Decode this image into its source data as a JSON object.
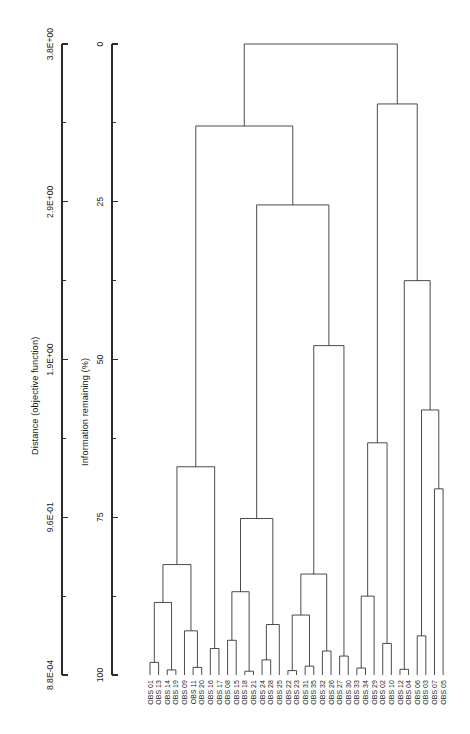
{
  "figure": {
    "kind": "dendrogram",
    "background_color": "#ffffff",
    "line_color": "#2b2b2b",
    "orientation": "labels-at-bottom-rotated"
  },
  "axes": {
    "distance": {
      "title": "Distance (objective function)",
      "tick_labels": [
        "8.8E-04",
        "9.6E-01",
        "1.9E+00",
        "2.9E+00",
        "3.8E+00"
      ],
      "tick_values": [
        0.00088,
        0.96,
        1.9,
        2.9,
        3.8
      ],
      "minor_ticks_between": 1
    },
    "information": {
      "title": "Information remaining (%)",
      "tick_labels": [
        "100",
        "75",
        "50",
        "25",
        "0"
      ],
      "tick_values": [
        100,
        75,
        50,
        25,
        0
      ],
      "minor_ticks_between": 1
    }
  },
  "chart_data": {
    "type": "dendrogram",
    "title": "",
    "xlabel": "",
    "ylabel": "Distance (objective function)",
    "secondary_ylabel": "Information remaining (%)",
    "distance_axis_range": [
      0.00088,
      3.8
    ],
    "information_axis_range": [
      100,
      0
    ],
    "grid": false,
    "legend": "none",
    "n_leaves": 35,
    "leaves": [
      "OBS 01",
      "OBS 13",
      "OBS 14",
      "OBS 19",
      "OBS 09",
      "OBS 11",
      "OBS 20",
      "OBS 16",
      "OBS 17",
      "OBS 08",
      "OBS 15",
      "OBS 18",
      "OBS 21",
      "OBS 24",
      "OBS 28",
      "OBS 25",
      "OBS 22",
      "OBS 23",
      "OBS 31",
      "OBS 35",
      "OBS 32",
      "OBS 26",
      "OBS 27",
      "OBS 30",
      "OBS 33",
      "OBS 34",
      "OBS 29",
      "OBS 02",
      "OBS 10",
      "OBS 12",
      "OBS 04",
      "OBS 06",
      "OBS 03",
      "OBS 07",
      "OBS 05"
    ],
    "merges": [
      {
        "id": "m1",
        "left": "OBS 01",
        "right": "OBS 13",
        "info_remaining": 98.0
      },
      {
        "id": "m2",
        "left": "OBS 14",
        "right": "OBS 19",
        "info_remaining": 99.2
      },
      {
        "id": "m3",
        "left": "m1",
        "right": "m2",
        "info_remaining": 88.5
      },
      {
        "id": "m4",
        "left": "OBS 11",
        "right": "OBS 20",
        "info_remaining": 98.8
      },
      {
        "id": "m5",
        "left": "OBS 09",
        "right": "m4",
        "info_remaining": 93.0
      },
      {
        "id": "m6",
        "left": "m3",
        "right": "m5",
        "info_remaining": 82.5
      },
      {
        "id": "m7",
        "left": "OBS 16",
        "right": "OBS 17",
        "info_remaining": 95.8
      },
      {
        "id": "m8",
        "left": "m6",
        "right": "m7",
        "info_remaining": 67.0
      },
      {
        "id": "m9",
        "left": "OBS 08",
        "right": "OBS 15",
        "info_remaining": 94.5
      },
      {
        "id": "m10",
        "left": "OBS 18",
        "right": "OBS 21",
        "info_remaining": 99.4
      },
      {
        "id": "m11",
        "left": "m9",
        "right": "m10",
        "info_remaining": 86.8
      },
      {
        "id": "m12",
        "left": "OBS 24",
        "right": "OBS 28",
        "info_remaining": 97.6
      },
      {
        "id": "m13",
        "left": "OBS 25",
        "right": "m12",
        "info_remaining": 92.0
      },
      {
        "id": "m14",
        "left": "m11",
        "right": "m13",
        "info_remaining": 75.2
      },
      {
        "id": "m15",
        "left": "OBS 22",
        "right": "OBS 23",
        "info_remaining": 99.3
      },
      {
        "id": "m16",
        "left": "OBS 31",
        "right": "OBS 35",
        "info_remaining": 98.6
      },
      {
        "id": "m17",
        "left": "m15",
        "right": "m16",
        "info_remaining": 90.5
      },
      {
        "id": "m18",
        "left": "OBS 32",
        "right": "OBS 26",
        "info_remaining": 96.2
      },
      {
        "id": "m19",
        "left": "m17",
        "right": "m18",
        "info_remaining": 84.0
      },
      {
        "id": "m20",
        "left": "OBS 27",
        "right": "OBS 30",
        "info_remaining": 97.0
      },
      {
        "id": "m21",
        "left": "m19",
        "right": "m20",
        "info_remaining": 47.8
      },
      {
        "id": "m22",
        "left": "m14",
        "right": "m21",
        "info_remaining": 25.5
      },
      {
        "id": "m23",
        "left": "OBS 33",
        "right": "OBS 34",
        "info_remaining": 98.9
      },
      {
        "id": "m24",
        "left": "OBS 29",
        "right": "m23",
        "info_remaining": 87.5
      },
      {
        "id": "m25",
        "left": "OBS 02",
        "right": "OBS 10",
        "info_remaining": 95.0
      },
      {
        "id": "m26",
        "left": "m24",
        "right": "m25",
        "info_remaining": 63.2
      },
      {
        "id": "m27",
        "left": "OBS 12",
        "right": "OBS 04",
        "info_remaining": 99.1
      },
      {
        "id": "m28",
        "left": "OBS 06",
        "right": "OBS 03",
        "info_remaining": 93.8
      },
      {
        "id": "m29",
        "left": "OBS 07",
        "right": "OBS 05",
        "info_remaining": 70.5
      },
      {
        "id": "m30",
        "left": "m28",
        "right": "m29",
        "info_remaining": 58.0
      },
      {
        "id": "m31",
        "left": "m27",
        "right": "m30",
        "info_remaining": 37.5
      },
      {
        "id": "m32",
        "left": "m26",
        "right": "m31",
        "info_remaining": 9.5
      },
      {
        "id": "m33",
        "left": "m8",
        "right": "m22",
        "info_remaining": 13.0
      },
      {
        "id": "m34",
        "left": "m33",
        "right": "m32",
        "info_remaining": 0.0
      }
    ]
  }
}
